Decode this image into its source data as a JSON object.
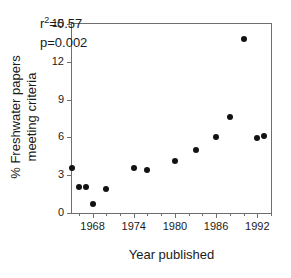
{
  "chart_data": {
    "type": "scatter",
    "title": "",
    "xlabel": "Year published",
    "ylabel": "% Freshwater papers meeting criteria",
    "ylabel_lines": [
      "% Freshwater papers",
      "meeting criteria"
    ],
    "xlim": [
      1965,
      1994
    ],
    "ylim": [
      0,
      15
    ],
    "xticks": [
      1968,
      1974,
      1980,
      1986,
      1992
    ],
    "xticklabels": [
      "1968",
      "1974",
      "1980",
      "1986",
      "1992"
    ],
    "xminor_step": 2,
    "yticks": [
      0,
      3,
      6,
      9,
      12,
      15
    ],
    "yticklabels": [
      "0",
      "3",
      "6",
      "9",
      "12",
      "15"
    ],
    "grid": false,
    "legend": null,
    "marker": "filled-circle",
    "marker_color": "#121212",
    "x": [
      1965,
      1966,
      1967,
      1968,
      1970,
      1974,
      1976,
      1980,
      1983,
      1986,
      1988,
      1990,
      1992,
      1993
    ],
    "y": [
      3.6,
      2.1,
      2.1,
      0.7,
      1.9,
      3.6,
      3.4,
      4.1,
      5.0,
      6.05,
      7.6,
      13.8,
      5.95,
      6.1
    ],
    "points": [
      {
        "x": 1965,
        "y": 3.6
      },
      {
        "x": 1966,
        "y": 2.1
      },
      {
        "x": 1967,
        "y": 2.1
      },
      {
        "x": 1968,
        "y": 0.7
      },
      {
        "x": 1970,
        "y": 1.9
      },
      {
        "x": 1974,
        "y": 3.6
      },
      {
        "x": 1976,
        "y": 3.4
      },
      {
        "x": 1980,
        "y": 4.1
      },
      {
        "x": 1983,
        "y": 5.0
      },
      {
        "x": 1986,
        "y": 6.05
      },
      {
        "x": 1988,
        "y": 7.6
      },
      {
        "x": 1990,
        "y": 13.8
      },
      {
        "x": 1992,
        "y": 5.95
      },
      {
        "x": 1993,
        "y": 6.1
      }
    ],
    "annotations": [
      {
        "text": "r²=0.57",
        "label": "r-squared"
      },
      {
        "text": "p=0.002",
        "label": "p-value"
      }
    ],
    "stats": {
      "r_squared_prefix": "r",
      "r_squared_exponent": "2",
      "r_squared_value": "=0.57",
      "p_value": "p=0.002"
    }
  }
}
